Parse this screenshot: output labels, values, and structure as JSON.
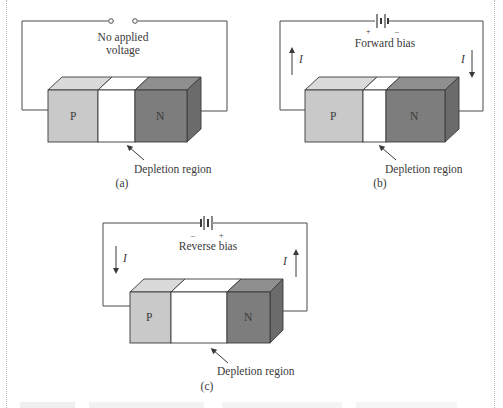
{
  "figure": {
    "panels": [
      {
        "id": "a",
        "condition_label_line1": "No applied",
        "condition_label_line2": "voltage",
        "p_label": "P",
        "n_label": "N",
        "depletion_label": "Depletion region",
        "panel_label": "(a)",
        "source": "open-terminals"
      },
      {
        "id": "b",
        "condition_label": "Forward bias",
        "plus_sign": "+",
        "minus_sign": "–",
        "current_left": "I",
        "current_right": "I",
        "p_label": "P",
        "n_label": "N",
        "depletion_label": "Depletion region",
        "panel_label": "(b)",
        "source": "battery"
      },
      {
        "id": "c",
        "condition_label": "Reverse bias",
        "plus_sign": "+",
        "minus_sign": "–",
        "current_left": "I",
        "current_right": "I",
        "p_label": "P",
        "n_label": "N",
        "depletion_label": "Depletion region",
        "panel_label": "(c)",
        "source": "battery"
      }
    ],
    "colors": {
      "p_front": "#c9c9c9",
      "p_top": "#dadada",
      "n_front": "#7d7d7d",
      "n_top": "#8f8f8f",
      "n_side": "#6b6b6b",
      "depletion": "#ffffff",
      "wire": "#4a4a4a",
      "text": "#3a3a3a"
    }
  }
}
